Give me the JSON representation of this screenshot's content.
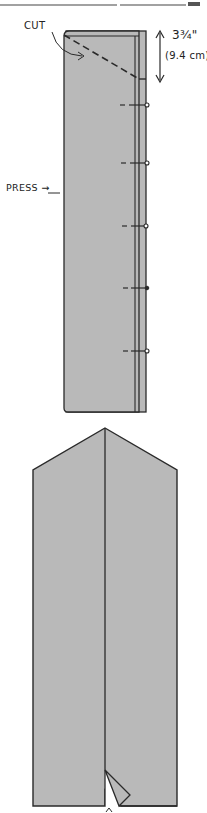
{
  "labels": {
    "cut": "CUT",
    "press": "PRESS →",
    "measurement_imperial": "3¾\"",
    "measurement_metric": "(9.4 cm)"
  },
  "colors": {
    "fabric_fill": "#b9b9b9",
    "outline": "#2a2a2a",
    "background": "#ffffff"
  },
  "figures": [
    {
      "id": "folded-strip",
      "description": "Folded strip with diagonal cut line, pressed edge and pins"
    },
    {
      "id": "pointed-piece",
      "description": "Opened strip with pointed top and center fold/notch"
    }
  ],
  "pins": {
    "count": 5,
    "y_positions": [
      105,
      163,
      226,
      288,
      351
    ]
  }
}
